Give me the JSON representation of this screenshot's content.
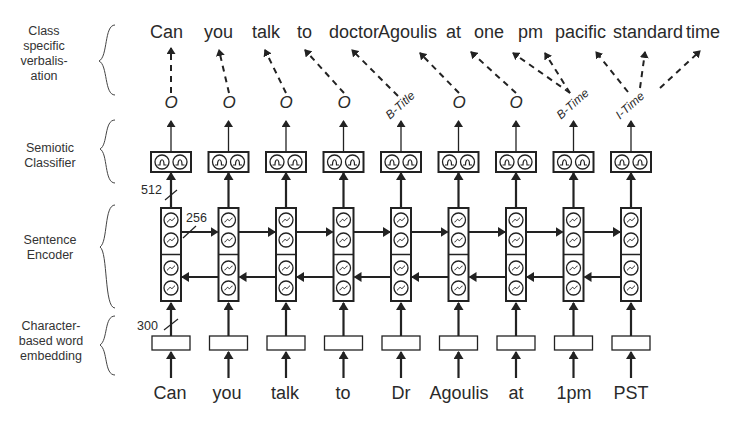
{
  "layers": {
    "verbalisation": "Class specific verbalisation",
    "verbalisation_lines": [
      "Class",
      "specific",
      "verbalis-",
      "ation"
    ],
    "classifier_lines": [
      "Semiotic",
      "Classifier"
    ],
    "encoder_lines": [
      "Sentence",
      "Encoder"
    ],
    "embedding_lines": [
      "Character-",
      "based word",
      "embedding"
    ]
  },
  "input_tokens": [
    "Can",
    "you",
    "talk",
    "to",
    "Dr",
    "Agoulis",
    "at",
    "1pm",
    "PST"
  ],
  "class_tags": [
    "O",
    "O",
    "O",
    "O",
    "B-Title",
    "O",
    "O",
    "B-Time",
    "I-Time"
  ],
  "output_words": [
    "Can",
    "you",
    "talk",
    "to",
    "doctor",
    "Agoulis",
    "at",
    "one",
    "pm",
    "pacific",
    "standard",
    "time"
  ],
  "dimensions": {
    "embedding": "300",
    "encoder_hidden": "256",
    "encoder_output": "512"
  },
  "colors": {
    "ink": "#2a2a2a",
    "background": "#ffffff"
  }
}
